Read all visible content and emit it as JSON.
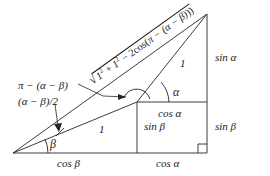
{
  "figure": {
    "stroke_color": "#262626",
    "background": "#ffffff"
  },
  "labels": {
    "chord_expression": {
      "radical_sign": "√",
      "radicand_a": "1",
      "exp_a": "2",
      "plus": " + ",
      "radicand_b": "1",
      "exp_b": "2",
      "minus": " − 2cos(",
      "inner": "π − (α − β)",
      "close": "))"
    },
    "supplement_angle": "π − (α − β)",
    "half_angle": "(α − β)/2",
    "unit_upper": "1",
    "unit_lower": "1",
    "alpha_angle": "α",
    "beta_angle": "β",
    "sin_alpha": "sin α",
    "sin_beta_right": "sin β",
    "sin_beta_inner": "sin β",
    "cos_alpha_mid": "cos α",
    "cos_alpha_bottom": "cos α",
    "cos_beta_bottom": "cos β"
  },
  "geometry": {
    "origin": [
      13,
      153
    ],
    "apex": [
      207,
      14
    ],
    "junction": [
      137,
      102
    ],
    "right_bottom": [
      207,
      153
    ],
    "mid_right": [
      207,
      102
    ],
    "inner_bottom": [
      137,
      153
    ]
  }
}
